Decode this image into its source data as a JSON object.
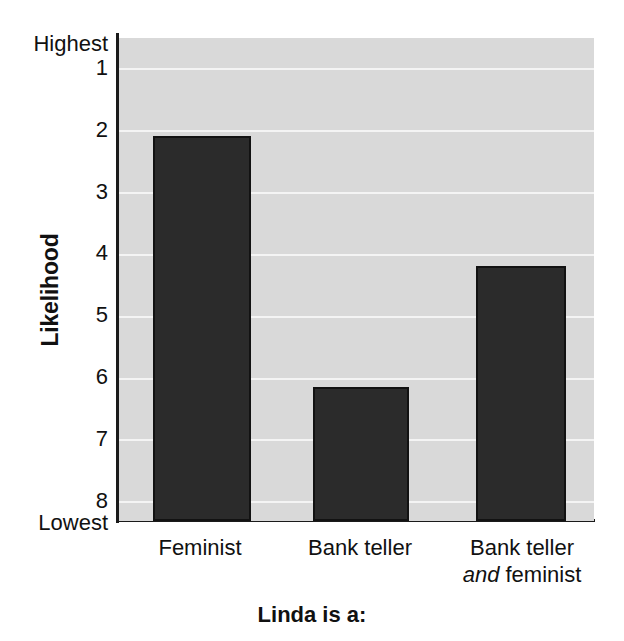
{
  "chart_data": {
    "type": "bar",
    "title": "",
    "subtitle": "",
    "xlabel": "Linda is a:",
    "ylabel": "Likelihood",
    "categories": [
      "Feminist",
      "Bank teller",
      "Bank teller and feminist"
    ],
    "category_lines": [
      [
        "Feminist"
      ],
      [
        "Bank teller"
      ],
      [
        "Bank teller",
        "and feminist"
      ]
    ],
    "values": [
      2.1,
      6.15,
      4.2
    ],
    "ylim": [
      1,
      8
    ],
    "y_inverted": true,
    "yticks": [
      1,
      2,
      3,
      4,
      5,
      6,
      7,
      8
    ],
    "yticklabels": [
      "1",
      "2",
      "3",
      "4",
      "5",
      "6",
      "7",
      "8"
    ],
    "y_axis_top_label": "Highest",
    "y_axis_bottom_label": "Lowest",
    "grid": true,
    "legend": null,
    "bar_color": "#2b2b2b",
    "bar_edge_color": "#121212",
    "plot_background": "#d9d9d9",
    "gridline_color": "#f4f4f4",
    "axis_color": "#1a1a1a",
    "text_color": "#111111"
  },
  "axis": {
    "y_title": "Likelihood",
    "highest_label": "Highest",
    "lowest_label": "Lowest",
    "tick_1": "1",
    "tick_2": "2",
    "tick_3": "3",
    "tick_4": "4",
    "tick_5": "5",
    "tick_6": "6",
    "tick_7": "7",
    "tick_8": "8",
    "x_title": "Linda is a:"
  },
  "categories": {
    "cat0_line0": "Feminist",
    "cat1_line0": "Bank teller",
    "cat2_line0": "Bank teller",
    "cat2_line1_em": "and",
    "cat2_line1_rest": " feminist"
  }
}
